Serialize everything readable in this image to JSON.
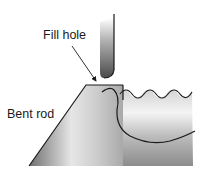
{
  "diagram": {
    "labels": {
      "fill_hole": "Fill hole",
      "bent_rod": "Bent rod"
    },
    "colors": {
      "outline": "#1a1a1a",
      "rod_dark": "#5a5a5a",
      "rod_light": "#e8e8e8",
      "base_light": "#f0f0f0",
      "base_dark": "#8a8a8a",
      "background": "#ffffff"
    }
  }
}
